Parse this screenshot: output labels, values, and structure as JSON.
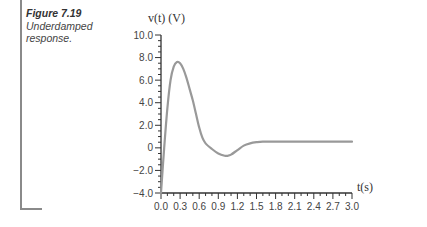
{
  "caption": {
    "figure_label": "Figure 7.19",
    "text": "Underdamped response."
  },
  "chart_data": {
    "type": "line",
    "title": "",
    "xlabel": "t(s)",
    "ylabel": "v(t) (V)",
    "xlim": [
      0.0,
      3.0
    ],
    "ylim": [
      -4.0,
      10.0
    ],
    "x_ticks": [
      "0.0",
      "0.3",
      "0.6",
      "0.9",
      "1.2",
      "1.5",
      "1.8",
      "2.1",
      "2.4",
      "2.7",
      "3.0"
    ],
    "y_ticks": [
      "10.0",
      "8.0",
      "6.0",
      "4.0",
      "2.0",
      "0",
      "-2.0",
      "-4.0"
    ],
    "grid": false,
    "legend": null,
    "series": [
      {
        "name": "v(t)",
        "color": "#999999",
        "x": [
          0.0,
          0.05,
          0.1,
          0.15,
          0.2,
          0.25,
          0.3,
          0.35,
          0.4,
          0.45,
          0.5,
          0.55,
          0.6,
          0.65,
          0.7,
          0.8,
          0.9,
          1.0,
          1.05,
          1.1,
          1.2,
          1.3,
          1.4,
          1.5,
          1.6,
          1.8,
          2.0,
          2.4,
          2.8,
          3.0
        ],
        "y": [
          -4.0,
          0.0,
          3.5,
          6.0,
          7.2,
          7.6,
          7.5,
          7.0,
          6.2,
          5.2,
          4.2,
          3.0,
          1.8,
          0.9,
          0.4,
          -0.1,
          -0.5,
          -0.7,
          -0.7,
          -0.6,
          -0.2,
          0.2,
          0.4,
          0.5,
          0.55,
          0.55,
          0.55,
          0.55,
          0.55,
          0.55
        ]
      }
    ]
  },
  "colors": {
    "curve": "#999999",
    "axis": "#333333",
    "frame": "#8a8a8a"
  }
}
